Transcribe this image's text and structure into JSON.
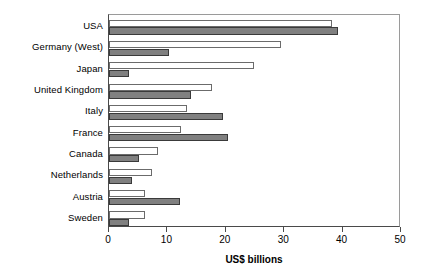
{
  "chart_data": {
    "type": "bar",
    "orientation": "horizontal",
    "title": "",
    "xlabel": "US$ billions",
    "ylabel": "",
    "xlim": [
      0,
      50
    ],
    "xticks": [
      0,
      10,
      20,
      30,
      40,
      50
    ],
    "xtick_labels": [
      "0",
      "10",
      "20",
      "30",
      "40",
      "50"
    ],
    "grid": false,
    "legend": false,
    "categories": [
      "USA",
      "Germany (West)",
      "Japan",
      "United Kingdom",
      "Italy",
      "France",
      "Canada",
      "Netherlands",
      "Austria",
      "Sweden"
    ],
    "series": [
      {
        "name": "series-1",
        "style": "white",
        "color": "#ffffff",
        "values": [
          38.1,
          29.4,
          24.8,
          17.6,
          13.4,
          12.3,
          8.4,
          7.3,
          6.2,
          6.2
        ]
      },
      {
        "name": "series-2",
        "style": "gray",
        "color": "#808080",
        "values": [
          39.2,
          10.2,
          3.5,
          14.0,
          19.5,
          20.3,
          5.1,
          3.9,
          12.2,
          3.4
        ]
      }
    ]
  },
  "axis": {
    "x_title": "US$ billions"
  },
  "colors": {
    "bar_white_fill": "#ffffff",
    "bar_gray_fill": "#808080",
    "bar_outline": "#4d4d4d",
    "axis": "#4a4a4a",
    "background": "#ffffff"
  }
}
